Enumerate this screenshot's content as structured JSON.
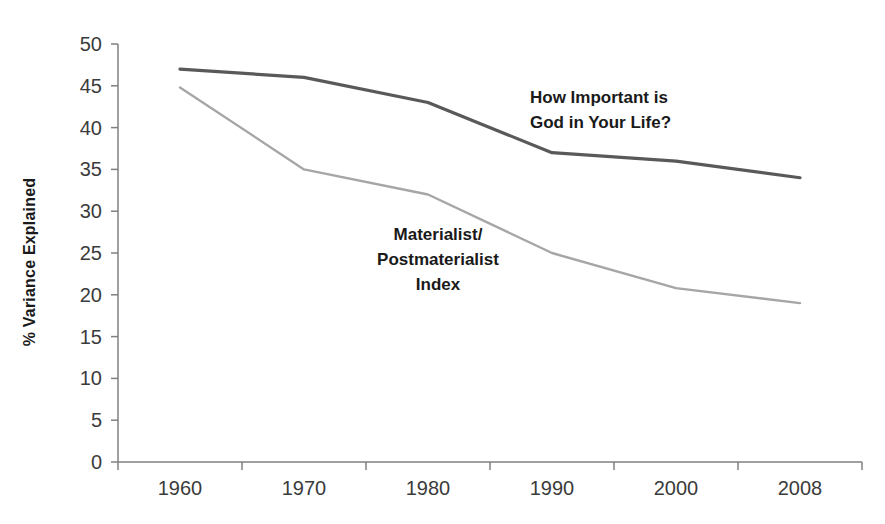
{
  "chart_data": {
    "type": "line",
    "title": "",
    "subtitle": "",
    "xlabel": "",
    "ylabel": "% Variance Explained",
    "categories": [
      "1960",
      "1970",
      "1980",
      "1990",
      "2000",
      "2008"
    ],
    "x": [
      "1960",
      "1970",
      "1980",
      "1990",
      "2000",
      "2008"
    ],
    "series": [
      {
        "name": "How Important is God in Your Life?",
        "color": "#595959",
        "values": [
          47,
          46,
          43,
          37,
          36,
          34
        ]
      },
      {
        "name": "Materialist/Postmaterialist Index",
        "color": "#a6a6a6",
        "values": [
          44.8,
          35,
          32,
          25,
          20.8,
          19
        ]
      }
    ],
    "ylim": [
      0,
      50
    ],
    "yticks": [
      0,
      5,
      10,
      15,
      20,
      25,
      30,
      35,
      40,
      45,
      50
    ],
    "ytick_labels": [
      "0",
      "5",
      "10",
      "15",
      "20",
      "25",
      "30",
      "35",
      "40",
      "45",
      "50"
    ],
    "grid": false,
    "legend": "none",
    "annotations": [
      {
        "id": "god-label",
        "lines": [
          "How Important is",
          "God in Your Life?"
        ],
        "align": "left",
        "x": 530,
        "y": 103,
        "line_height": 25,
        "color": "#1a1a1a"
      },
      {
        "id": "materialist-label",
        "lines": [
          "Materialist/",
          "Postmaterialist",
          "Index"
        ],
        "align": "middle",
        "x": 438,
        "y": 240,
        "line_height": 25,
        "color": "#1a1a1a"
      }
    ],
    "axis_color": "#808080",
    "background": "#ffffff"
  }
}
